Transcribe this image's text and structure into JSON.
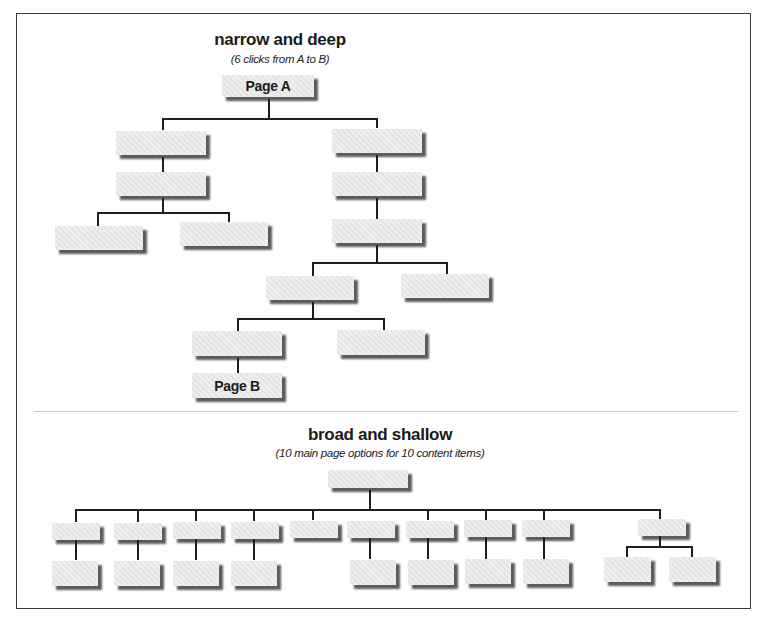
{
  "narrow": {
    "title": "narrow and deep",
    "subtitle": "(6 clicks from A to B)",
    "page_a_label": "Page A",
    "page_b_label": "Page B"
  },
  "broad": {
    "title": "broad and shallow",
    "subtitle": "(10 main page options for 10 content items)"
  },
  "colors": {
    "box_fill": "#e9e9e9",
    "box_shadow": "#5b5b5b",
    "connector": "#1e1e1e",
    "frame": "#3a3a3a"
  }
}
